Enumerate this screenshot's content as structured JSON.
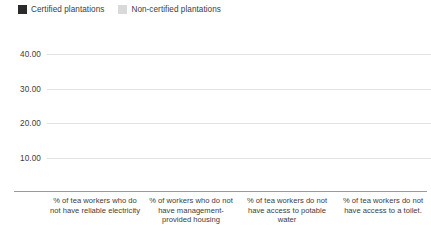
{
  "legend": {
    "position": "top-left",
    "entries": [
      {
        "label": "Certified plantations",
        "color": "#2b2b2b",
        "swatch_name": "legend-swatch-certified"
      },
      {
        "label": "Non-certified plantations",
        "color": "#d9d9d9",
        "swatch_name": "legend-swatch-non-certified"
      }
    ]
  },
  "axis": {
    "y_ticks": [
      "10.00",
      "20.00",
      "30.00",
      "40.00"
    ]
  },
  "chart_data": {
    "type": "bar",
    "title": "",
    "subtitle": "",
    "xlabel": "",
    "ylabel": "",
    "ylim": [
      0,
      50
    ],
    "y_ticks": [
      10,
      20,
      30,
      40
    ],
    "y_tick_labels": [
      "10.00",
      "20.00",
      "30.00",
      "40.00"
    ],
    "grid": true,
    "legend_position": "top-left",
    "categories": [
      "% of tea workers who do not have reliable electricity",
      "% of workers who do not have management-provided housing",
      "% of tea workers do not have access to potable water",
      "% of tea workers do not have access to a toilet."
    ],
    "series": [
      {
        "name": "Certified plantations",
        "color": "#2b2b2b",
        "values": [
          40.18,
          24.47,
          48.94,
          30.21
        ],
        "labels": [
          "40.18",
          "24.47",
          "48.94",
          "30.21"
        ]
      },
      {
        "name": "Non-certified plantations",
        "color": "#d9d9d9",
        "values": [
          22.93,
          20.49,
          43.41,
          20.49
        ],
        "labels": [
          "22.93",
          "20.49",
          "43.41",
          "20.49"
        ]
      }
    ]
  }
}
